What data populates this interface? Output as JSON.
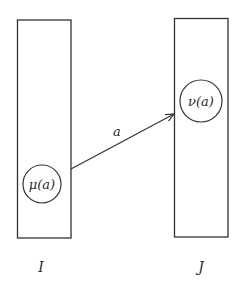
{
  "diagram": {
    "colors": {
      "stroke": "#333333",
      "text": "#2a2a2a",
      "background": "#ffffff"
    },
    "sets": [
      {
        "id": "I",
        "label": "I",
        "element": {
          "func": "μ",
          "arg": "a",
          "display": "μ(a)"
        }
      },
      {
        "id": "J",
        "label": "J",
        "element": {
          "func": "ν",
          "arg": "a",
          "display": "ν(a)"
        }
      }
    ],
    "arrow": {
      "label": "a",
      "from": "μ(a)",
      "to": "J"
    }
  }
}
